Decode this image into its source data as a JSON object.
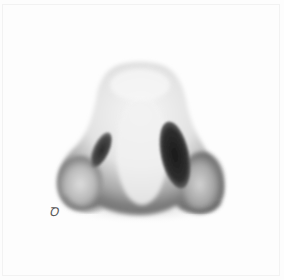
{
  "image": {
    "subject": "pencil drawing of a nose viewed from below",
    "style": "graphite shading on white paper",
    "signature": "Ꝺ"
  },
  "colors": {
    "paper": "#fdfdfd",
    "skin_light": "#f0f0f0",
    "skin_mid": "#b5b5b5",
    "shadow": "#5a5a5a",
    "nostril": "#1e1e1e"
  }
}
